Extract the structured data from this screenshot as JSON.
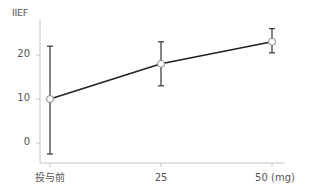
{
  "chart_data": {
    "type": "line",
    "title": "",
    "xlabel": "",
    "ylabel": "IIEF",
    "x_unit": "(mg)",
    "categories": [
      "投与前",
      "25",
      "50"
    ],
    "series": [
      {
        "name": "IIEF",
        "values": [
          10,
          18,
          23
        ],
        "error_upper": [
          22,
          23,
          26
        ],
        "error_lower": [
          -2.5,
          13,
          20.5
        ]
      }
    ],
    "y_ticks": [
      0,
      10,
      20
    ],
    "ylim": [
      -4.5,
      27.5
    ],
    "grid": false,
    "legend": null
  },
  "labels": {
    "y_axis": "IIEF",
    "y_ticks": [
      "20",
      "10",
      "0"
    ],
    "x_ticks": [
      "投与前",
      "25",
      "50 (mg)"
    ]
  },
  "colors": {
    "line": "#222222",
    "axis": "#bbbbbb",
    "marker_fill": "#ffffff",
    "marker_stroke": "#888888",
    "text": "#555555"
  }
}
